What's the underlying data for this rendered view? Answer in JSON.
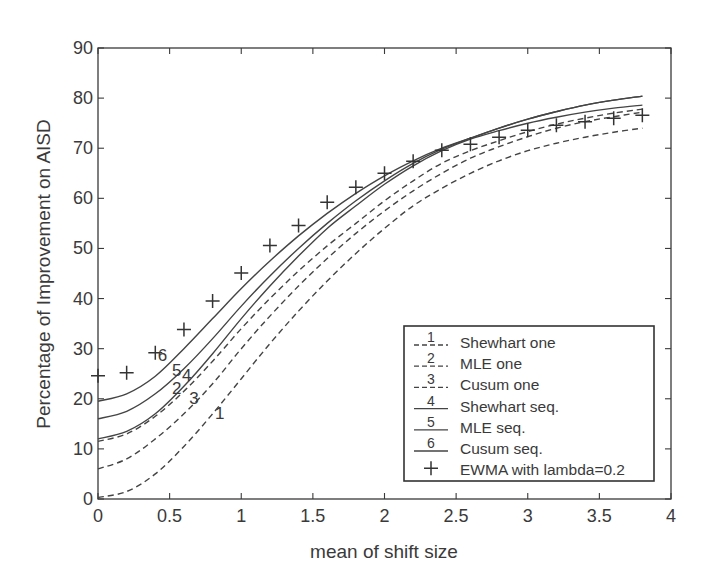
{
  "chart_data": {
    "type": "line",
    "title": "",
    "xlabel": "mean of shift size",
    "ylabel": "Percentage of Improvement on AISD",
    "xlim": [
      0,
      4
    ],
    "ylim": [
      0,
      90
    ],
    "xticks": [
      0,
      0.5,
      1,
      1.5,
      2,
      2.5,
      3,
      3.5,
      4
    ],
    "xtick_labels": [
      "0",
      "0.5",
      "1",
      "1.5",
      "2",
      "2.5",
      "3",
      "3.5",
      "4"
    ],
    "yticks": [
      0,
      10,
      20,
      30,
      40,
      50,
      60,
      70,
      80,
      90
    ],
    "ytick_labels": [
      "0",
      "10",
      "20",
      "30",
      "40",
      "50",
      "60",
      "70",
      "80",
      "90"
    ],
    "grid": false,
    "legend_position": "lower right",
    "x": [
      0,
      0.2,
      0.4,
      0.6,
      0.8,
      1.0,
      1.2,
      1.4,
      1.6,
      1.8,
      2.0,
      2.2,
      2.4,
      2.6,
      2.8,
      3.0,
      3.2,
      3.4,
      3.6,
      3.8
    ],
    "series": [
      {
        "id": "1",
        "name": "Shewhart one",
        "style": "dashed",
        "label_at": [
          0.85,
          16
        ],
        "values": [
          0.3,
          1.5,
          5.0,
          10.5,
          17.0,
          24.0,
          31.0,
          37.5,
          43.5,
          49.0,
          54.0,
          58.5,
          62.0,
          65.0,
          67.5,
          69.5,
          71.0,
          72.2,
          73.2,
          74.0
        ]
      },
      {
        "id": "2",
        "name": "MLE one",
        "style": "dashed",
        "label_at": [
          0.55,
          21
        ],
        "values": [
          11.5,
          13.0,
          16.5,
          21.5,
          27.5,
          34.0,
          40.0,
          45.5,
          50.5,
          55.0,
          59.5,
          63.5,
          67.0,
          69.5,
          71.5,
          73.3,
          74.8,
          76.0,
          77.0,
          77.8
        ]
      },
      {
        "id": "3",
        "name": "Cusum one",
        "style": "dashed",
        "label_at": [
          0.67,
          19
        ],
        "values": [
          6.0,
          8.0,
          12.0,
          17.0,
          23.0,
          30.0,
          36.5,
          42.5,
          48.0,
          53.0,
          57.5,
          61.5,
          65.0,
          68.0,
          70.3,
          72.3,
          74.0,
          75.3,
          76.3,
          77.2
        ]
      },
      {
        "id": "4",
        "name": "Shewhart seq.",
        "style": "solid",
        "label_at": [
          0.62,
          23.5
        ],
        "values": [
          12.0,
          13.5,
          17.0,
          22.5,
          29.0,
          36.0,
          42.5,
          48.5,
          54.0,
          58.5,
          62.8,
          66.5,
          69.5,
          71.8,
          73.5,
          75.0,
          76.2,
          77.2,
          78.0,
          78.6
        ]
      },
      {
        "id": "5",
        "name": "MLE seq.",
        "style": "solid",
        "label_at": [
          0.55,
          24.5
        ],
        "values": [
          16.0,
          17.5,
          21.0,
          26.0,
          32.0,
          38.5,
          44.5,
          50.0,
          55.0,
          59.5,
          63.5,
          67.0,
          69.8,
          72.0,
          74.0,
          75.8,
          77.3,
          78.6,
          79.6,
          80.4
        ]
      },
      {
        "id": "6",
        "name": "Cusum seq.",
        "style": "solid",
        "label_at": [
          0.45,
          27.5
        ],
        "values": [
          19.5,
          21.0,
          24.5,
          30.0,
          36.0,
          42.0,
          47.5,
          52.5,
          57.0,
          61.0,
          64.5,
          67.5,
          70.0,
          72.0,
          74.0,
          75.8,
          77.3,
          78.6,
          79.6,
          80.4
        ]
      },
      {
        "id": "+",
        "name": "EWMA with lambda=0.2",
        "style": "marker-plus",
        "values": [
          24.6,
          25.2,
          29.2,
          33.8,
          39.5,
          45.1,
          50.6,
          54.6,
          59.2,
          62.2,
          65.0,
          67.4,
          69.6,
          70.8,
          72.2,
          73.6,
          74.6,
          75.3,
          76.0,
          76.6
        ]
      }
    ]
  },
  "legend": {
    "items": [
      {
        "key": "1",
        "label": "Shewhart one",
        "style": "dashed"
      },
      {
        "key": "2",
        "label": "MLE one",
        "style": "dashed"
      },
      {
        "key": "3",
        "label": "Cusum one",
        "style": "dashed"
      },
      {
        "key": "4",
        "label": "Shewhart seq.",
        "style": "solid"
      },
      {
        "key": "5",
        "label": "MLE seq.",
        "style": "solid"
      },
      {
        "key": "6",
        "label": "Cusum seq.",
        "style": "solid"
      },
      {
        "key": "+",
        "label": "EWMA with lambda=0.2",
        "style": "marker-plus"
      }
    ]
  },
  "colors": {
    "line": "#444444",
    "axis": "#3a3a3a",
    "background": "#ffffff"
  }
}
